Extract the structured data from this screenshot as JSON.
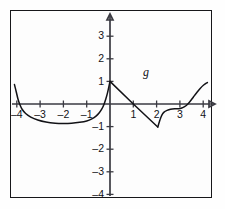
{
  "figure": {
    "background_color": "#fdfdfd",
    "border_color": "#17171a",
    "axis_color": "#3a3a42",
    "curve_color": "#121216"
  },
  "function_label": {
    "text": "g",
    "x": 1.55,
    "y": 1.35
  },
  "chart_data": {
    "type": "line",
    "title": "",
    "xlabel": "",
    "ylabel": "",
    "xlim": [
      -4.6,
      4.7
    ],
    "ylim": [
      -4.35,
      3.9
    ],
    "grid": false,
    "legend": null,
    "x_ticks": [
      -4,
      -3,
      -2,
      -1,
      1,
      2,
      3,
      4
    ],
    "x_tick_labels": [
      "–4",
      "–3",
      "–2",
      "–1",
      "1",
      "2",
      "3",
      "4"
    ],
    "y_ticks": [
      3,
      2,
      1,
      -1,
      -2,
      -3,
      -4
    ],
    "y_tick_labels": [
      "3",
      "2",
      "1",
      "–1",
      "–2",
      "–3",
      "–4"
    ],
    "x_axis_arrow": "right",
    "y_axis_arrow": "up",
    "series": [
      {
        "name": "g",
        "comment": "Left branch: steep drop from (-4.1, 0.85), smooth U-shaped arc with minimum near (-2, -0.86), rising steeply to the peak at (0, 1).",
        "points": [
          [
            -4.1,
            0.86
          ],
          [
            -4.02,
            0.52
          ],
          [
            -3.95,
            0.22
          ],
          [
            -3.88,
            0.0
          ],
          [
            -3.78,
            -0.22
          ],
          [
            -3.62,
            -0.42
          ],
          [
            -3.4,
            -0.58
          ],
          [
            -3.1,
            -0.71
          ],
          [
            -2.75,
            -0.8
          ],
          [
            -2.35,
            -0.85
          ],
          [
            -2.0,
            -0.86
          ],
          [
            -1.65,
            -0.85
          ],
          [
            -1.3,
            -0.81
          ],
          [
            -1.0,
            -0.75
          ],
          [
            -0.78,
            -0.66
          ],
          [
            -0.6,
            -0.54
          ],
          [
            -0.46,
            -0.39
          ],
          [
            -0.35,
            -0.22
          ],
          [
            -0.26,
            -0.02
          ],
          [
            -0.18,
            0.22
          ],
          [
            -0.11,
            0.48
          ],
          [
            -0.05,
            0.76
          ],
          [
            0.0,
            1.0
          ]
        ]
      },
      {
        "name": "g",
        "comment": "Straight descending segment from the peak (0, 1) through the zero at (1, 0) down to the vertex (2.05, -1.02).",
        "points": [
          [
            0.0,
            1.0
          ],
          [
            1.0,
            0.0
          ],
          [
            2.05,
            -1.02
          ]
        ]
      },
      {
        "name": "g",
        "comment": "Right branch: steep rise out of the vertex, flattening into a shallow trough near (2.8, -0.2), crossing zero near (3.3) then sweeping up to (4.2, 0.95).",
        "points": [
          [
            2.05,
            -1.02
          ],
          [
            2.14,
            -0.72
          ],
          [
            2.22,
            -0.5
          ],
          [
            2.32,
            -0.36
          ],
          [
            2.45,
            -0.28
          ],
          [
            2.6,
            -0.23
          ],
          [
            2.78,
            -0.21
          ],
          [
            2.95,
            -0.21
          ],
          [
            3.08,
            -0.18
          ],
          [
            3.2,
            -0.12
          ],
          [
            3.32,
            -0.02
          ],
          [
            3.45,
            0.13
          ],
          [
            3.58,
            0.31
          ],
          [
            3.72,
            0.5
          ],
          [
            3.86,
            0.68
          ],
          [
            4.02,
            0.84
          ],
          [
            4.18,
            0.95
          ]
        ]
      }
    ],
    "key_features": {
      "x_intercepts": [
        -3.88,
        1.0,
        3.32
      ],
      "local_minima": [
        [
          -2.0,
          -0.86
        ],
        [
          2.05,
          -1.02
        ],
        [
          2.85,
          -0.21
        ]
      ],
      "local_maxima": [
        [
          0.0,
          1.0
        ]
      ],
      "corner_points": [
        [
          0.0,
          1.0
        ],
        [
          2.05,
          -1.02
        ]
      ]
    }
  }
}
